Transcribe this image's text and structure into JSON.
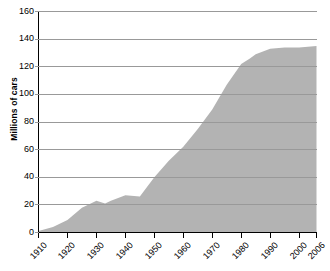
{
  "chart_data": {
    "type": "area",
    "title": "",
    "xlabel": "",
    "ylabel": "Millions of cars",
    "xlim": [
      1910,
      2006
    ],
    "ylim": [
      0,
      160
    ],
    "grid": true,
    "legend": "none",
    "fill_color": "#b3b3b3",
    "grid_color": "#999999",
    "axis_color": "#000000",
    "background": "#ffffff",
    "ytick_labels": [
      "160",
      "140",
      "120",
      "100",
      "80",
      "60",
      "40",
      "20",
      "0"
    ],
    "ytick_values": [
      160,
      140,
      120,
      100,
      80,
      60,
      40,
      20,
      0
    ],
    "xtick_labels": [
      "1910",
      "1920",
      "1930",
      "1940",
      "1950",
      "1960",
      "1970",
      "1980",
      "1990",
      "2000",
      "2006"
    ],
    "xtick_values": [
      1910,
      1920,
      1930,
      1940,
      1950,
      1960,
      1970,
      1980,
      1990,
      2000,
      2006
    ],
    "x": [
      1910,
      1915,
      1920,
      1925,
      1930,
      1933,
      1935,
      1940,
      1945,
      1950,
      1955,
      1960,
      1965,
      1970,
      1975,
      1980,
      1983,
      1985,
      1990,
      1995,
      2000,
      2006
    ],
    "values": [
      1,
      4,
      9,
      18,
      23,
      21,
      23,
      27,
      26,
      40,
      52,
      62,
      75,
      89,
      107,
      122,
      126,
      129,
      133,
      134,
      134,
      135
    ],
    "series": [
      {
        "name": "Cars",
        "values": [
          1,
          4,
          9,
          18,
          23,
          21,
          23,
          27,
          26,
          40,
          52,
          62,
          75,
          89,
          107,
          122,
          126,
          129,
          133,
          134,
          134,
          135
        ]
      }
    ]
  },
  "axis": {
    "y_title": "Millions of cars"
  }
}
